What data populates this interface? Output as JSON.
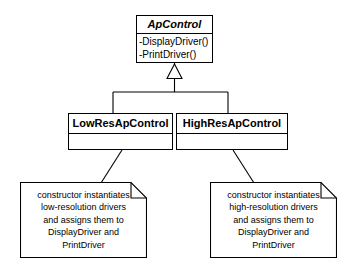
{
  "diagram": {
    "type": "uml-class-diagram",
    "background_color": "#ffffff",
    "line_color": "#000000",
    "text_color": "#000000"
  },
  "classes": {
    "superclass": {
      "name": "ApControl",
      "abstract": true,
      "operations": [
        "-DisplayDriver()",
        "-PrintDriver()"
      ]
    },
    "subclasses": [
      {
        "name": "LowResApControl",
        "operations": []
      },
      {
        "name": "HighResApControl",
        "operations": []
      }
    ]
  },
  "notes": [
    {
      "target": "LowResApControl",
      "lines": [
        "constructor instantiates",
        "low-resolution drivers",
        "and assigns them to",
        "DisplayDriver and",
        "PrintDriver"
      ]
    },
    {
      "target": "HighResApControl",
      "lines": [
        "constructor instantiates",
        "high-resolution drivers",
        "and assigns them to",
        "DisplayDriver and",
        "PrintDriver"
      ]
    }
  ],
  "relationships": {
    "generalization": {
      "kind": "inheritance",
      "arrowhead": "hollow-triangle",
      "parent": "ApControl",
      "children": [
        "LowResApControl",
        "HighResApControl"
      ]
    },
    "note_anchors": [
      {
        "note": 0,
        "attached_to": "LowResApControl",
        "style": "solid-line"
      },
      {
        "note": 1,
        "attached_to": "HighResApControl",
        "style": "solid-line"
      }
    ]
  }
}
